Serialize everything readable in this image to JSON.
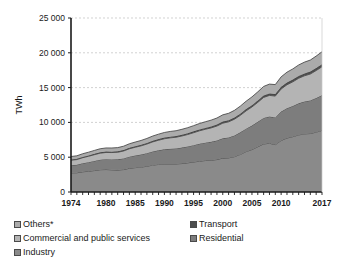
{
  "chart_data": {
    "type": "area",
    "stacked": true,
    "title": "",
    "xlabel": "",
    "ylabel": "TWh",
    "ylim": [
      0,
      25000
    ],
    "xlim": [
      1974,
      2017
    ],
    "grid": true,
    "grid_axis": "y",
    "legend_position": "below",
    "y_ticks": [
      0,
      5000,
      10000,
      15000,
      20000,
      25000
    ],
    "y_tick_labels": [
      "0",
      "5 000",
      "10 000",
      "15 000",
      "20 000",
      "25 000"
    ],
    "x_tick_labels": [
      "1974",
      "1980",
      "1985",
      "1990",
      "1995",
      "2000",
      "2005",
      "2010",
      "2017"
    ],
    "x_tick_values": [
      1974,
      1980,
      1985,
      1990,
      1995,
      2000,
      2005,
      2010,
      2017
    ],
    "x": [
      1974,
      1975,
      1976,
      1977,
      1978,
      1979,
      1980,
      1981,
      1982,
      1983,
      1984,
      1985,
      1986,
      1987,
      1988,
      1989,
      1990,
      1991,
      1992,
      1993,
      1994,
      1995,
      1996,
      1997,
      1998,
      1999,
      2000,
      2001,
      2002,
      2003,
      2004,
      2005,
      2006,
      2007,
      2008,
      2009,
      2010,
      2011,
      2012,
      2013,
      2014,
      2015,
      2016,
      2017
    ],
    "series": [
      {
        "name": "Industry",
        "color": "#8a8a8a",
        "values": [
          2750,
          2760,
          2900,
          2980,
          3080,
          3200,
          3230,
          3180,
          3150,
          3220,
          3400,
          3500,
          3570,
          3700,
          3860,
          3960,
          4030,
          4030,
          4030,
          4090,
          4190,
          4310,
          4420,
          4520,
          4560,
          4660,
          4870,
          4900,
          5080,
          5400,
          5800,
          6100,
          6500,
          6900,
          7000,
          6800,
          7400,
          7750,
          7950,
          8200,
          8350,
          8400,
          8600,
          8850
        ]
      },
      {
        "name": "Residential",
        "color": "#7d7d7d",
        "values": [
          1100,
          1150,
          1230,
          1300,
          1380,
          1440,
          1480,
          1500,
          1540,
          1600,
          1680,
          1740,
          1810,
          1880,
          1960,
          2030,
          2100,
          2170,
          2220,
          2290,
          2350,
          2420,
          2510,
          2570,
          2650,
          2740,
          2840,
          2930,
          3040,
          3170,
          3300,
          3440,
          3580,
          3740,
          3840,
          3910,
          4150,
          4280,
          4400,
          4540,
          4650,
          4750,
          4900,
          5050
        ]
      },
      {
        "name": "Commercial and public services",
        "color": "#b4b4b4",
        "values": [
          720,
          750,
          800,
          850,
          900,
          940,
          970,
          990,
          1020,
          1070,
          1130,
          1190,
          1250,
          1310,
          1380,
          1450,
          1520,
          1580,
          1620,
          1670,
          1720,
          1790,
          1860,
          1920,
          2000,
          2080,
          2180,
          2250,
          2340,
          2440,
          2560,
          2680,
          2800,
          2950,
          3040,
          3070,
          3250,
          3380,
          3480,
          3600,
          3700,
          3800,
          3950,
          4100
        ]
      },
      {
        "name": "Transport",
        "color": "#4d4d4d",
        "values": [
          110,
          112,
          115,
          118,
          122,
          126,
          128,
          130,
          132,
          136,
          140,
          145,
          150,
          155,
          160,
          166,
          172,
          176,
          178,
          182,
          186,
          192,
          198,
          203,
          209,
          215,
          222,
          226,
          232,
          240,
          249,
          258,
          267,
          278,
          286,
          290,
          305,
          315,
          324,
          333,
          341,
          348,
          358,
          368
        ]
      },
      {
        "name": "Others*",
        "color": "#ababab",
        "values": [
          420,
          430,
          450,
          470,
          490,
          510,
          520,
          525,
          535,
          555,
          580,
          600,
          625,
          650,
          680,
          705,
          730,
          745,
          755,
          775,
          795,
          820,
          850,
          875,
          905,
          935,
          975,
          1000,
          1040,
          1085,
          1135,
          1185,
          1240,
          1300,
          1340,
          1360,
          1440,
          1490,
          1530,
          1580,
          1620,
          1660,
          1720,
          1780
        ]
      }
    ]
  },
  "legend": {
    "rows": [
      {
        "left": {
          "label": "Others*",
          "color": "#ababab",
          "name": "legend-item-others"
        },
        "right": {
          "label": "Transport",
          "color": "#4d4d4d",
          "name": "legend-item-transport"
        }
      },
      {
        "left": {
          "label": "Commercial and public services",
          "color": "#b4b4b4",
          "name": "legend-item-commercial"
        },
        "right": {
          "label": "Residential",
          "color": "#7d7d7d",
          "name": "legend-item-residential"
        }
      },
      {
        "left": {
          "label": "Industry",
          "color": "#8a8a8a",
          "name": "legend-item-industry"
        },
        "right": null
      }
    ]
  },
  "colors": {
    "axis": "#1a1a1a",
    "grid": "#bfbfbf",
    "plot_background": "#ffffff",
    "series_line": "#3c3c3c"
  }
}
